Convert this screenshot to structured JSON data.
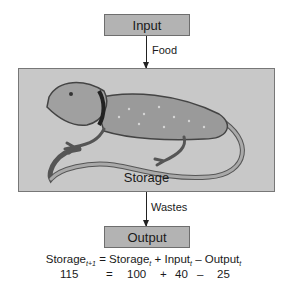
{
  "diagram": {
    "input_label": "Input",
    "input_arrow_label": "Food",
    "storage_label": "Storage",
    "storage_image": "lizard-illustration",
    "output_arrow_label": "Wastes",
    "output_label": "Output",
    "colors": {
      "box_fill": "#b3b3b3",
      "storage_fill": "#c8c8c8",
      "border": "#6e6e6e",
      "arrow": "#222222"
    }
  },
  "equation": {
    "lhs": "Storage",
    "lhs_sub": "t+1",
    "eq": "=",
    "term1": "Storage",
    "term1_sub": "t",
    "plus": "+",
    "term2": "Input",
    "term2_sub": "t",
    "minus": "–",
    "term3": "Output",
    "term3_sub": "t"
  },
  "values": {
    "storage_next": "115",
    "eq": "=",
    "storage": "100",
    "plus": "+",
    "input": "40",
    "minus": "–",
    "output": "25"
  }
}
